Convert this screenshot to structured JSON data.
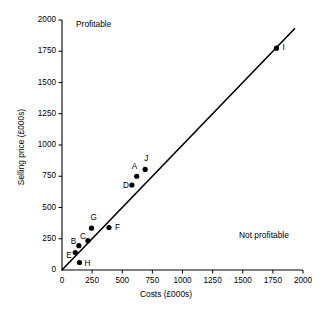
{
  "chart_data": {
    "type": "scatter",
    "title": "",
    "xlabel": "Costs (£000s)",
    "ylabel": "Selling price (£000s)",
    "xlim": [
      0,
      2000
    ],
    "ylim": [
      0,
      2000
    ],
    "xticks": [
      0,
      250,
      500,
      750,
      1000,
      1250,
      1500,
      1750,
      2000
    ],
    "yticks": [
      0,
      250,
      500,
      750,
      1000,
      1250,
      1500,
      1750,
      2000
    ],
    "xtick_labels": [
      "0",
      "250",
      "500",
      "750",
      "1000",
      "1250",
      "1500",
      "1750",
      "2000"
    ],
    "ytick_labels": [
      "0",
      "250",
      "500",
      "750",
      "1000",
      "1250",
      "1500",
      "1750",
      "2000"
    ],
    "grid": false,
    "legend": "none",
    "points": [
      {
        "label": "E",
        "x": 110,
        "y": 140,
        "label_dx": -9,
        "label_dy": 3
      },
      {
        "label": "B",
        "x": 140,
        "y": 195,
        "label_dx": -8,
        "label_dy": -4
      },
      {
        "label": "C",
        "x": 215,
        "y": 235,
        "label_dx": -8,
        "label_dy": -4
      },
      {
        "label": "H",
        "x": 145,
        "y": 60,
        "label_dx": 5,
        "label_dy": 1
      },
      {
        "label": "G",
        "x": 245,
        "y": 335,
        "label_dx": -1,
        "label_dy": -10
      },
      {
        "label": "F",
        "x": 390,
        "y": 340,
        "label_dx": 6,
        "label_dy": 0
      },
      {
        "label": "D",
        "x": 580,
        "y": 680,
        "label_dx": -9,
        "label_dy": 1
      },
      {
        "label": "A",
        "x": 620,
        "y": 750,
        "label_dx": -5,
        "label_dy": -9
      },
      {
        "label": "J",
        "x": 690,
        "y": 805,
        "label_dx": -1,
        "label_dy": -10
      },
      {
        "label": "I",
        "x": 1780,
        "y": 1775,
        "label_dx": 6,
        "label_dy": 0
      }
    ],
    "reference_line": {
      "name": "break-even-line",
      "from": [
        0,
        0
      ],
      "to": [
        1930,
        1930
      ],
      "description": "break-even line where selling price equals costs"
    },
    "annotations": [
      {
        "name": "profitable",
        "text": "Profitable"
      },
      {
        "name": "not-profitable",
        "text": "Not profitable"
      }
    ]
  }
}
